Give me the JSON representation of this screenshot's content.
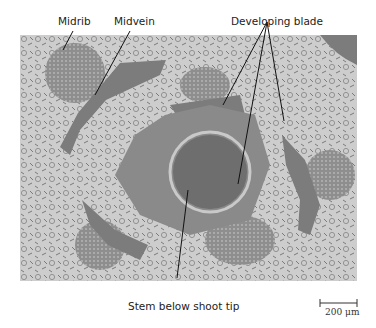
{
  "figure": {
    "labels": {
      "midrib": "Midrib",
      "midvein": "Midvein",
      "developing_blade": "Developing blade",
      "stem": "Stem below shoot tip"
    },
    "scale_bar": "200 μm",
    "colors": {
      "background": "#ffffff",
      "tissue_light": "#c9c9c9",
      "tissue_dark": "#6e6e6e",
      "leader": "#111111"
    }
  }
}
